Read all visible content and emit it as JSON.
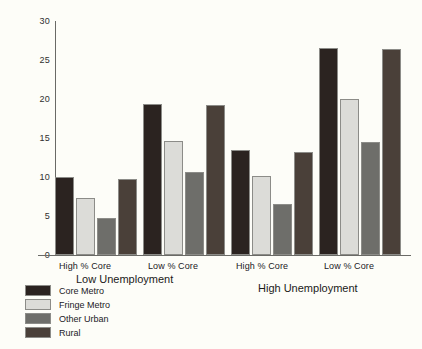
{
  "chart_data": {
    "type": "bar",
    "title": "",
    "xlabel": "",
    "ylabel": "",
    "ylim": [
      0,
      30
    ],
    "ytick_labels": [
      "0",
      "5",
      "10",
      "15",
      "20",
      "25",
      "30"
    ],
    "ytick_values": [
      0,
      5,
      10,
      15,
      20,
      25,
      30
    ],
    "grid": false,
    "legend_position": "bottom-left",
    "categories": [
      "High % Core",
      "Low % Core",
      "High % Core",
      "Low % Core"
    ],
    "group_labels": [
      "Low Unemployment",
      "High Unemployment"
    ],
    "series": [
      {
        "name": "Core Metro",
        "color": "#2b2320",
        "values": [
          10.0,
          19.4,
          13.4,
          26.5
        ]
      },
      {
        "name": "Fringe Metro",
        "color": "#dcdcd8",
        "values": [
          7.3,
          14.6,
          10.1,
          20.0
        ]
      },
      {
        "name": "Other Urban",
        "color": "#6e6e6a",
        "values": [
          4.8,
          10.6,
          6.5,
          14.5
        ]
      },
      {
        "name": "Rural",
        "color": "#4a4039",
        "values": [
          9.7,
          19.2,
          13.2,
          26.4
        ]
      }
    ]
  },
  "axis": {
    "y_labels": [
      "30",
      "25",
      "20",
      "15",
      "10",
      "5",
      "0"
    ]
  },
  "categories": {
    "c0": "High % Core",
    "c1": "Low % Core",
    "c2": "High % Core",
    "c3": "Low % Core"
  },
  "panels": {
    "p0": "Low Unemployment",
    "p1": "High Unemployment"
  },
  "legend": {
    "items": [
      {
        "label": "Core Metro"
      },
      {
        "label": "Fringe Metro"
      },
      {
        "label": "Other Urban"
      },
      {
        "label": "Rural"
      }
    ]
  }
}
